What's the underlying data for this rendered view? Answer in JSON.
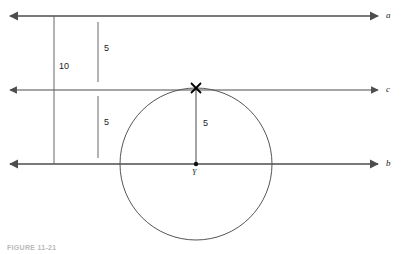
{
  "figure": {
    "caption": "FIGURE 11-21",
    "background_color": "#ffffff",
    "stroke_color": "#4d4d4d",
    "circle_color": "#555555",
    "text_color": "#1a1a1a",
    "width": 403,
    "height": 254
  },
  "lines": [
    {
      "id": "line-a",
      "label": "a",
      "label_x": 386,
      "label_y": 12,
      "y": 16,
      "x_start": 10,
      "x_end": 378,
      "arrow_left": true,
      "arrow_right": true
    },
    {
      "id": "line-c",
      "label": "c",
      "label_x": 386,
      "label_y": 86,
      "y": 90,
      "x_start": 10,
      "x_end": 378,
      "arrow_left": true,
      "arrow_right": true
    },
    {
      "id": "line-b",
      "label": "b",
      "label_x": 386,
      "label_y": 160,
      "y": 164,
      "x_start": 10,
      "x_end": 378,
      "arrow_left": true,
      "arrow_right": true
    }
  ],
  "measurements": [
    {
      "id": "measure-a-to-b",
      "value": "10",
      "x": 54,
      "y_start": 16,
      "y_end": 164,
      "label_x": 59,
      "label_y": 66,
      "from_line": "a",
      "to_line": "b"
    },
    {
      "id": "measure-a-to-c",
      "value": "5",
      "x": 98,
      "y_start": 22,
      "y_end": 82,
      "label_x": 104,
      "label_y": 48,
      "from_line": "a",
      "to_line": "c"
    },
    {
      "id": "measure-c-to-b",
      "value": "5",
      "x": 98,
      "y_start": 96,
      "y_end": 158,
      "label_x": 104,
      "label_y": 122,
      "from_line": "c",
      "to_line": "b"
    },
    {
      "id": "measure-radius",
      "value": "5",
      "x": 196,
      "y_start": 90,
      "y_end": 164,
      "label_x": 203,
      "label_y": 123,
      "from_line": "c",
      "to_line": "b"
    }
  ],
  "circle": {
    "id": "tangent-circle",
    "center_x": 196,
    "center_y": 164,
    "radius": 76,
    "tangent_line": "c",
    "center_point_label": "Y",
    "center_label_x": 192,
    "center_label_y": 171,
    "tangent_point_label": "X",
    "tangent_point_x": 196,
    "tangent_point_y": 88,
    "tangent_label_x": 192,
    "tangent_label_y": 81
  }
}
